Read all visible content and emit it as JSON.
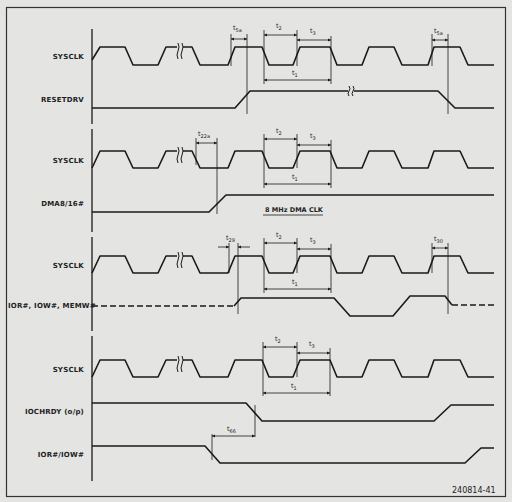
{
  "figure": {
    "figure_id": "240814-41",
    "background": "#e4e4e2",
    "line_color": "#1a1a1a"
  },
  "sections": [
    {
      "name": "reset",
      "signals": [
        {
          "label": "SYSCLK"
        },
        {
          "label": "RESETDRV"
        }
      ],
      "timings": [
        {
          "prefix": "t",
          "sub": "5a"
        },
        {
          "prefix": "t",
          "sub": "2"
        },
        {
          "prefix": "t",
          "sub": "3"
        },
        {
          "prefix": "t",
          "sub": "1"
        },
        {
          "prefix": "t",
          "sub": "5a"
        }
      ]
    },
    {
      "name": "dma",
      "signals": [
        {
          "label": "SYSCLK"
        },
        {
          "label": "DMA8/16#"
        }
      ],
      "timings": [
        {
          "prefix": "t",
          "sub": "22a"
        },
        {
          "prefix": "t",
          "sub": "2"
        },
        {
          "prefix": "t",
          "sub": "3"
        },
        {
          "prefix": "t",
          "sub": "1"
        }
      ],
      "note": "8 MHz DMA CLK"
    },
    {
      "name": "io-mem",
      "signals": [
        {
          "label": "SYSCLK"
        },
        {
          "label": "IOR#, IOW#, MEMW#"
        }
      ],
      "timings": [
        {
          "prefix": "t",
          "sub": "29"
        },
        {
          "prefix": "t",
          "sub": "2"
        },
        {
          "prefix": "t",
          "sub": "3"
        },
        {
          "prefix": "t",
          "sub": "1"
        },
        {
          "prefix": "t",
          "sub": "30"
        }
      ]
    },
    {
      "name": "iochrdy",
      "signals": [
        {
          "label": "SYSCLK"
        },
        {
          "label": "IOCHRDY (o/p)"
        },
        {
          "label": "IOR#/IOW#"
        }
      ],
      "timings": [
        {
          "prefix": "t",
          "sub": "2"
        },
        {
          "prefix": "t",
          "sub": "3"
        },
        {
          "prefix": "t",
          "sub": "1"
        },
        {
          "prefix": "t",
          "sub": "66"
        }
      ]
    }
  ]
}
